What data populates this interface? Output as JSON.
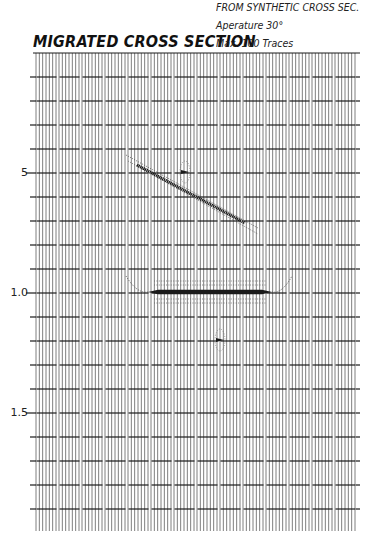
{
  "header": {
    "title": "MIGRATED CROSS SECTION",
    "subtitle_lines": [
      "FROM SYNTHETIC CROSS SEC.",
      "Aperature 30°",
      "Max. 100 Traces"
    ]
  },
  "axis": {
    "time_labels": [
      {
        "label": "5",
        "y": 173
      },
      {
        "label": "1.0",
        "y": 293
      },
      {
        "label": "1.5",
        "y": 413
      }
    ]
  },
  "layout": {
    "trace_left": 35,
    "trace_right": 357,
    "trace_top": 53,
    "trace_bottom": 531,
    "group_count": 14,
    "traces_per_group": 7,
    "timing_lines_y": [
      53,
      77,
      101,
      125,
      149,
      173,
      197,
      221,
      245,
      269,
      293,
      317,
      341,
      365,
      389,
      413,
      437,
      461,
      485,
      509
    ],
    "timing_left": 30,
    "timing_right": 360
  },
  "events": {
    "dipping_reflector": {
      "x1": 137,
      "y1": 165,
      "x2": 245,
      "y2": 223,
      "tail_x1": 126,
      "tail_y1": 157,
      "tail_x2": 258,
      "tail_y2": 230
    },
    "flat_reflector": {
      "x1": 148,
      "x2": 272,
      "y": 292,
      "smile_x1": 126,
      "smile_x2": 292,
      "smile_top": 276
    },
    "point_diffractors": [
      {
        "x": 185,
        "y": 172
      },
      {
        "x": 220,
        "y": 340
      }
    ]
  },
  "colors": {
    "ink": "#1a1a1a",
    "trace": "#6f6f6f",
    "paper": "#ffffff"
  }
}
